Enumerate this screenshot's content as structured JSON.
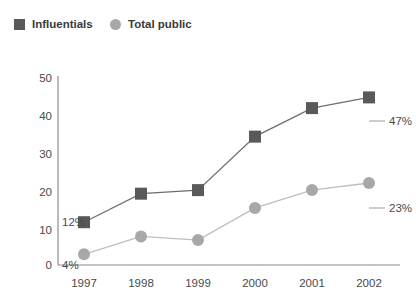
{
  "legend": {
    "items": [
      {
        "label": "Influentials",
        "marker": "square-marker-icon",
        "color": "#58595b"
      },
      {
        "label": "Total public",
        "marker": "circle-marker-icon",
        "color": "#a6a8ab"
      }
    ]
  },
  "axes": {
    "y_ticks": [
      "0",
      "10",
      "20",
      "30",
      "40",
      "50"
    ],
    "x_ticks": [
      "1997",
      "1998",
      "1999",
      "2000",
      "2001",
      "2002"
    ]
  },
  "annotations": {
    "influentials_start": "12%",
    "influentials_end": "47%",
    "total_public_start": "4%",
    "total_public_end": "23%"
  },
  "chart_data": {
    "type": "line",
    "title": "",
    "subtitle": "",
    "xlabel": "",
    "ylabel": "",
    "x": [
      "1997",
      "1998",
      "1999",
      "2000",
      "2001",
      "2002"
    ],
    "categories": [
      "1997",
      "1998",
      "1999",
      "2000",
      "2001",
      "2002"
    ],
    "ylim": [
      0,
      53
    ],
    "yticks": [
      0,
      10,
      20,
      30,
      40,
      50
    ],
    "grid": false,
    "legend_position": "top-left",
    "series": [
      {
        "name": "Influentials",
        "color": "#58595b",
        "marker": "square",
        "values": [
          12,
          20,
          21,
          36,
          44,
          47
        ],
        "point_labels": [
          "12%",
          "",
          "",
          "",
          "",
          "47%"
        ]
      },
      {
        "name": "Total public",
        "color": "#a6a8ab",
        "marker": "circle",
        "values": [
          3,
          8,
          7,
          16,
          21,
          23
        ],
        "point_labels": [
          "4%",
          "",
          "",
          "",
          "",
          "23%"
        ]
      }
    ]
  }
}
